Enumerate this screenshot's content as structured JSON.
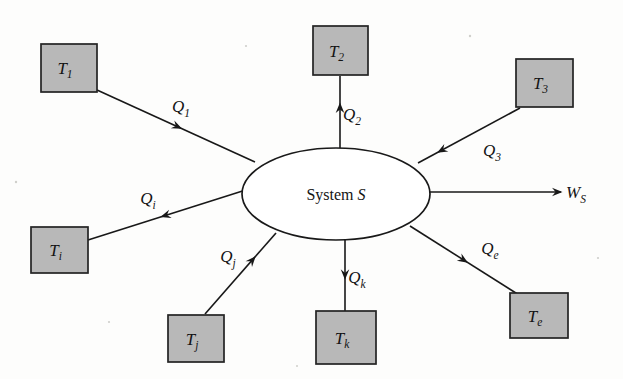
{
  "figure": {
    "background_color": "#fdfdfc",
    "line_color": "#181818",
    "box_fill_color": "#b8b8b8",
    "box_stroke_color": "#232323",
    "ellipse_fill_color": "#ffffff"
  },
  "system": {
    "name": "system-ellipse",
    "label_text": "System",
    "label_symbol": "S",
    "cx": 336,
    "cy": 194,
    "rx": 94,
    "ry": 46
  },
  "reservoirs": [
    {
      "id": "T1",
      "name": "reservoir-box-t1",
      "base": "T",
      "subscript": "1",
      "subscript_style": "upright",
      "x": 41,
      "y": 44,
      "w": 56,
      "h": 48
    },
    {
      "id": "T2",
      "name": "reservoir-box-t2",
      "base": "T",
      "subscript": "2",
      "subscript_style": "upright",
      "x": 313,
      "y": 26,
      "w": 55,
      "h": 49
    },
    {
      "id": "T3",
      "name": "reservoir-box-t3",
      "base": "T",
      "subscript": "3",
      "subscript_style": "upright",
      "x": 516,
      "y": 59,
      "w": 57,
      "h": 48
    },
    {
      "id": "Ti",
      "name": "reservoir-box-ti",
      "base": "T",
      "subscript": "i",
      "subscript_style": "italic",
      "x": 31,
      "y": 227,
      "w": 57,
      "h": 46
    },
    {
      "id": "Tj",
      "name": "reservoir-box-tj",
      "base": "T",
      "subscript": "j",
      "subscript_style": "italic",
      "x": 168,
      "y": 315,
      "w": 56,
      "h": 47
    },
    {
      "id": "Tk",
      "name": "reservoir-box-tk",
      "base": "T",
      "subscript": "k",
      "subscript_style": "italic",
      "x": 316,
      "y": 311,
      "w": 60,
      "h": 53
    },
    {
      "id": "Te",
      "name": "reservoir-box-te",
      "base": "T",
      "subscript": "e",
      "subscript_style": "italic",
      "x": 510,
      "y": 293,
      "w": 58,
      "h": 45
    }
  ],
  "flows": [
    {
      "id": "Q1",
      "name": "flow-q1",
      "base": "Q",
      "subscript": "1",
      "subscript_style": "upright",
      "direction": "into-system",
      "from": "T1",
      "to": "system",
      "x1": 97,
      "y1": 90,
      "x2": 255,
      "y2": 162,
      "arrow_at": 0.53,
      "label_x": 181,
      "label_y": 112
    },
    {
      "id": "Q2",
      "name": "flow-q2",
      "base": "Q",
      "subscript": "2",
      "subscript_style": "upright",
      "direction": "out-of-system",
      "from": "system",
      "to": "T2",
      "x1": 340,
      "y1": 150,
      "x2": 340,
      "y2": 76,
      "arrow_at": 0.62,
      "label_x": 352,
      "label_y": 120
    },
    {
      "id": "Q3",
      "name": "flow-q3",
      "base": "Q",
      "subscript": "3",
      "subscript_style": "upright",
      "direction": "into-system",
      "from": "T3",
      "to": "system",
      "x1": 520,
      "y1": 108,
      "x2": 418,
      "y2": 163,
      "arrow_at": 0.8,
      "label_x": 492,
      "label_y": 156
    },
    {
      "id": "Qi",
      "name": "flow-qi",
      "base": "Q",
      "subscript": "i",
      "subscript_style": "italic",
      "direction": "out-of-system",
      "from": "system",
      "to": "Ti",
      "x1": 252,
      "y1": 188,
      "x2": 88,
      "y2": 240,
      "arrow_at": 0.55,
      "label_x": 148,
      "label_y": 204
    },
    {
      "id": "Qj",
      "name": "flow-qj",
      "base": "Q",
      "subscript": "j",
      "subscript_style": "italic",
      "direction": "into-system",
      "from": "Tj",
      "to": "system",
      "x1": 205,
      "y1": 314,
      "x2": 276,
      "y2": 233,
      "arrow_at": 0.7,
      "label_x": 228,
      "label_y": 262
    },
    {
      "id": "Qk",
      "name": "flow-qk",
      "base": "Q",
      "subscript": "k",
      "subscript_style": "italic",
      "direction": "out-of-system",
      "from": "system",
      "to": "Tk",
      "x1": 345,
      "y1": 240,
      "x2": 345,
      "y2": 311,
      "arrow_at": 0.54,
      "label_x": 357,
      "label_y": 283
    },
    {
      "id": "Qe",
      "name": "flow-qe",
      "base": "Q",
      "subscript": "e",
      "subscript_style": "italic",
      "direction": "out-of-system",
      "from": "system",
      "to": "Te",
      "x1": 410,
      "y1": 226,
      "x2": 519,
      "y2": 295,
      "arrow_at": 0.52,
      "label_x": 490,
      "label_y": 254
    },
    {
      "id": "WS",
      "name": "flow-work-ws",
      "base": "W",
      "subscript": "S",
      "subscript_style": "italic",
      "direction": "out-of-system",
      "from": "system",
      "to": "surroundings",
      "x1": 430,
      "y1": 192,
      "x2": 561,
      "y2": 192,
      "arrow_at": 1.0,
      "label_x": 576,
      "label_y": 198
    }
  ]
}
